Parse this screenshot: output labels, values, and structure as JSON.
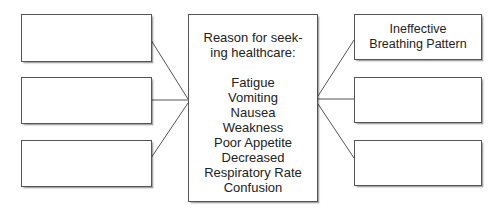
{
  "diagram": {
    "center": {
      "heading_line1": "Reason for seek-",
      "heading_line2": "ing healthcare:",
      "items": [
        "Fatigue",
        "Vomiting",
        "Nausea",
        "Weakness",
        "Poor Appetite",
        "Decreased",
        "Respiratory Rate",
        "Confusion"
      ]
    },
    "left_boxes": [
      {
        "text": ""
      },
      {
        "text": ""
      },
      {
        "text": ""
      }
    ],
    "right_boxes": [
      {
        "line1": "Ineffective",
        "line2": "Breathing Pattern"
      },
      {
        "line1": "",
        "line2": ""
      },
      {
        "line1": "",
        "line2": ""
      }
    ],
    "line_color": "#555555"
  }
}
